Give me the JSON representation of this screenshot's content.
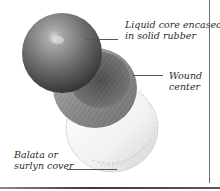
{
  "diagram": {
    "labels": [
      {
        "id": "core",
        "line1": "Liquid core encased",
        "line2": "in solid rubber"
      },
      {
        "id": "wound",
        "line1": "Wound",
        "line2": "center"
      },
      {
        "id": "cover",
        "line1": "Balata or",
        "line2": "surlyn cover"
      }
    ]
  },
  "colors": {
    "core_highlight": "#c9c9c9",
    "core_shadow": "#3a3a3a",
    "wound_band": "#9a9a9a",
    "cover": "#f4f4f4",
    "border": "#6a6a6a",
    "text": "#2a2a2a"
  }
}
